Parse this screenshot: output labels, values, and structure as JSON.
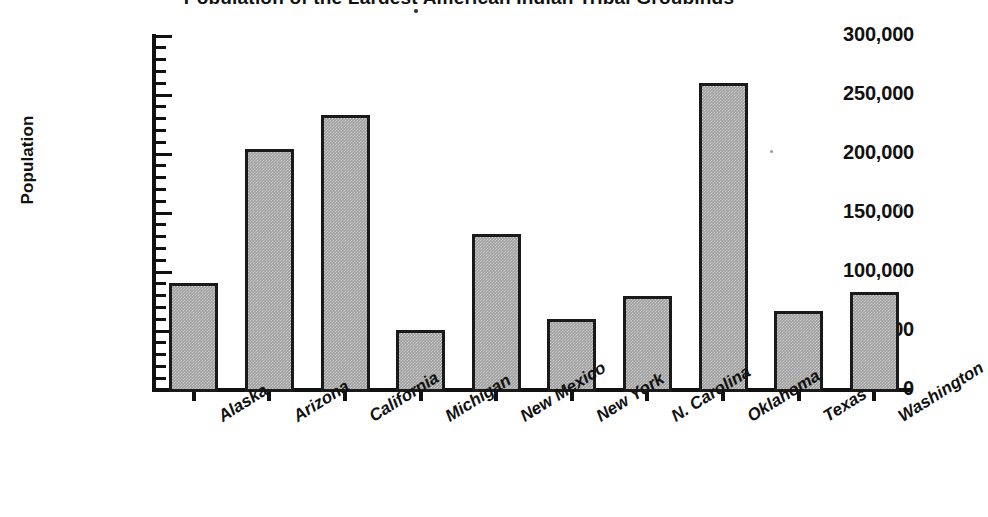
{
  "chart_data": {
    "type": "bar",
    "title": "Population of the Largest American Indian Tribal Groupings",
    "xlabel": "",
    "ylabel": "Population",
    "ylim": [
      0,
      300000
    ],
    "ytick_values": [
      0,
      50000,
      100000,
      150000,
      200000,
      250000,
      300000
    ],
    "ytick_labels": [
      "0",
      "50,000",
      "100,000",
      "150,000",
      "200,000",
      "250,000",
      "300,000"
    ],
    "y_minor_tick_step": 10000,
    "grid": false,
    "legend": "none",
    "bar_fill_color": "#9c9c9c",
    "bar_border_color": "#1a1a1a",
    "categories": [
      "Alaska",
      "Arizona",
      "California",
      "Michigan",
      "New Mexico",
      "New York",
      "N. Carolina",
      "Oklahoma",
      "Texas",
      "Washington"
    ],
    "values": [
      91000,
      204000,
      233000,
      51000,
      132000,
      60000,
      80000,
      260000,
      67000,
      83000
    ]
  }
}
